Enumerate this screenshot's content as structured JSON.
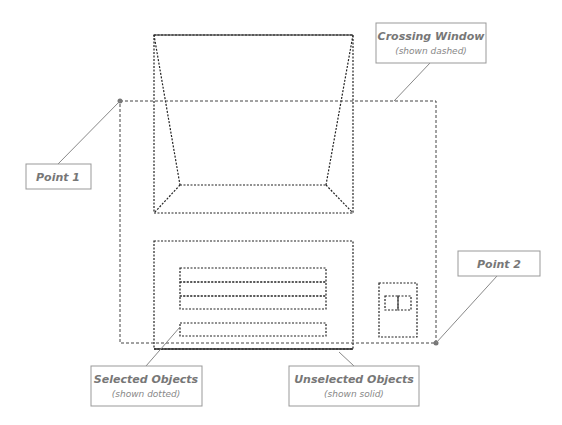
{
  "diagram": {
    "callouts": {
      "crossing_window": {
        "title": "Crossing Window",
        "subtitle": "(shown dashed)"
      },
      "point1": {
        "title": "Point 1"
      },
      "point2": {
        "title": "Point 2"
      },
      "selected_objects": {
        "title": "Selected Objects",
        "subtitle": "(shown dotted)"
      },
      "unselected_objects": {
        "title": "Unselected Objects",
        "subtitle": "(shown solid)"
      }
    },
    "colors": {
      "object_stroke": "#222222",
      "window_stroke": "#444444",
      "callout_border": "#999999",
      "callout_text": "#777777",
      "leader_line": "#888888"
    }
  }
}
